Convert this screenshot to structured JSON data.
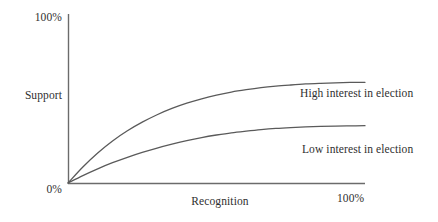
{
  "chart_data": {
    "type": "line",
    "title": "",
    "subtitle": "",
    "xlabel": "Recognition",
    "ylabel": "Support",
    "xticklabels": [
      "0%",
      "100%"
    ],
    "yticklabels": [
      "0%",
      "100%"
    ],
    "xlim": [
      0,
      100
    ],
    "ylim": [
      0,
      100
    ],
    "grid": false,
    "legend_position": "inline-right-of-curves",
    "axis_style": "open-left-bottom-spines",
    "line_color": "#5a5a5a",
    "axis_color": "#6b6b6b",
    "text_color": "#2f2f2f",
    "background": "#ffffff",
    "annotations": [
      "High interest in election",
      "Low interest in election"
    ],
    "series": [
      {
        "name": "High interest in election",
        "label": "High interest in election",
        "x": [
          0,
          5,
          10,
          15,
          20,
          25,
          30,
          35,
          40,
          45,
          50,
          55,
          60,
          65,
          70,
          75,
          80,
          85,
          90,
          95,
          100
        ],
        "values": [
          0,
          9.5,
          17.8,
          24.9,
          30.9,
          36.0,
          40.4,
          44.1,
          47.2,
          49.8,
          52.0,
          53.8,
          55.2,
          56.4,
          57.3,
          58.0,
          58.6,
          59.0,
          59.3,
          59.5,
          59.6
        ]
      },
      {
        "name": "Low interest in election",
        "label": "Low interest in election",
        "x": [
          0,
          5,
          10,
          15,
          20,
          25,
          30,
          35,
          40,
          45,
          50,
          55,
          60,
          65,
          70,
          75,
          80,
          85,
          90,
          95,
          100
        ],
        "values": [
          0,
          4.4,
          8.4,
          12.0,
          15.2,
          18.1,
          20.7,
          23.0,
          25.1,
          26.9,
          28.4,
          29.7,
          30.7,
          31.6,
          32.3,
          32.8,
          33.2,
          33.5,
          33.7,
          33.8,
          33.9
        ]
      }
    ]
  },
  "axis": {
    "y_max_label": "100%",
    "y_min_label": "0%",
    "y_title": "Support",
    "x_title": "Recognition",
    "x_max_label": "100%"
  },
  "series_labels": {
    "high": "High interest in election",
    "low": "Low interest in election"
  }
}
